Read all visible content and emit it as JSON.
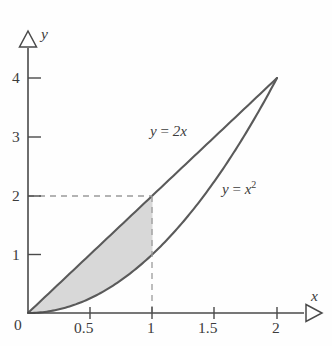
{
  "chart_data": {
    "type": "line",
    "title": "",
    "xlabel": "x",
    "ylabel": "y",
    "xlim": [
      0,
      2.35
    ],
    "ylim": [
      0,
      4.45
    ],
    "grid": false,
    "legend_position": "inline-labels",
    "x_ticks": [
      {
        "value": 0,
        "label": "0"
      },
      {
        "value": 0.5,
        "label": "0.5"
      },
      {
        "value": 1,
        "label": "1"
      },
      {
        "value": 1.5,
        "label": "1.5"
      },
      {
        "value": 2,
        "label": "2"
      }
    ],
    "y_ticks": [
      {
        "value": 1,
        "label": "1"
      },
      {
        "value": 2,
        "label": "2"
      },
      {
        "value": 3,
        "label": "3"
      },
      {
        "value": 4,
        "label": "4"
      }
    ],
    "series": [
      {
        "name": "y = 2x",
        "label_html": "y&nbsp;=&nbsp;2x",
        "type": "line",
        "color": "#5a5a5a",
        "x": [
          0,
          0.25,
          0.5,
          0.75,
          1,
          1.25,
          1.5,
          1.75,
          2
        ],
        "values": [
          0,
          0.5,
          1,
          1.5,
          2,
          2.5,
          3,
          3.5,
          4
        ]
      },
      {
        "name": "y = x^2",
        "label_html": "y&nbsp;=&nbsp;x²",
        "type": "line",
        "color": "#5a5a5a",
        "x": [
          0,
          0.25,
          0.5,
          0.75,
          1,
          1.25,
          1.5,
          1.75,
          2
        ],
        "values": [
          0,
          0.0625,
          0.25,
          0.5625,
          1,
          1.5625,
          2.25,
          3.0625,
          4
        ]
      }
    ],
    "shaded_region": {
      "between": [
        "y = 2x",
        "y = x^2"
      ],
      "x_from": 0,
      "x_to": 1,
      "fill": "#d8d8d8"
    },
    "annotations": [
      {
        "name": "dashed-horizontal",
        "type": "dashed-line",
        "from": [
          0,
          2
        ],
        "to": [
          1,
          2
        ],
        "color": "#9a9a9a"
      },
      {
        "name": "dashed-vertical",
        "type": "dashed-line",
        "from": [
          1,
          0
        ],
        "to": [
          1,
          2
        ],
        "color": "#9a9a9a"
      },
      {
        "name": "intersection-origin",
        "type": "point",
        "at": [
          0,
          0
        ]
      },
      {
        "name": "intersection-apex",
        "type": "point",
        "at": [
          2,
          4
        ]
      }
    ]
  },
  "axes": {
    "x_axis_label": "x",
    "y_axis_label": "y",
    "origin_label": "0",
    "arrowhead_style": "hollow-triangle",
    "axis_color": "#4a4a4a"
  },
  "labels": {
    "line_label": "y = 2x",
    "line_label_parts": {
      "lhs": "y",
      "eq": " = ",
      "rhs": "2x"
    },
    "parabola_label": "y = x2",
    "parabola_label_parts": {
      "lhs": "y",
      "eq": " = ",
      "rhs": "x",
      "exponent": "2"
    },
    "tick_x_0": "0",
    "tick_x_05": "0.5",
    "tick_x_1": "1",
    "tick_x_15": "1.5",
    "tick_x_2": "2",
    "tick_y_1": "1",
    "tick_y_2": "2",
    "tick_y_3": "3",
    "tick_y_4": "4"
  },
  "colors": {
    "curve": "#5a5a5a",
    "fill": "#d8d8d8",
    "dashed": "#9a9a9a",
    "axis": "#4a4a4a",
    "text": "#3c3c3c",
    "background": "#fefefe"
  }
}
